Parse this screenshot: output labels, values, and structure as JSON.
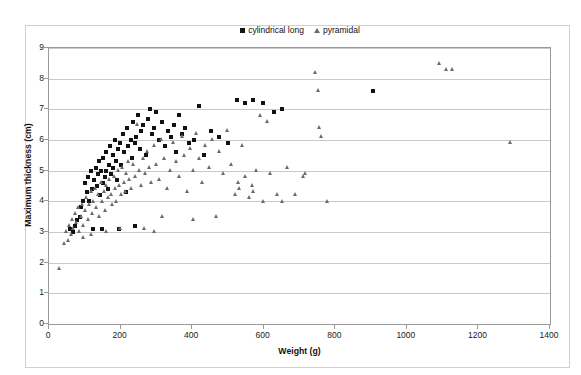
{
  "chart_data": {
    "type": "scatter",
    "title": "",
    "xlabel": "Weight (g)",
    "ylabel": "Maximum thickness (cm)",
    "xlim": [
      0,
      1400
    ],
    "ylim": [
      0,
      9
    ],
    "xticks": [
      0,
      200,
      400,
      600,
      800,
      1000,
      1200,
      1400
    ],
    "yticks": [
      0,
      1,
      2,
      3,
      4,
      5,
      6,
      7,
      8,
      9
    ],
    "grid": "horizontal",
    "legend_position": "top-center",
    "series": [
      {
        "name": "cylindrical long",
        "marker": "square",
        "color": "#121212",
        "points": [
          [
            95,
            4.0
          ],
          [
            100,
            4.6
          ],
          [
            105,
            4.3
          ],
          [
            110,
            4.8
          ],
          [
            112,
            4.0
          ],
          [
            118,
            5.0
          ],
          [
            120,
            4.4
          ],
          [
            124,
            3.1
          ],
          [
            126,
            4.7
          ],
          [
            130,
            5.1
          ],
          [
            134,
            4.5
          ],
          [
            138,
            4.9
          ],
          [
            140,
            5.3
          ],
          [
            142,
            4.2
          ],
          [
            146,
            5.0
          ],
          [
            150,
            4.6
          ],
          [
            152,
            5.4
          ],
          [
            156,
            4.8
          ],
          [
            158,
            5.6
          ],
          [
            160,
            5.0
          ],
          [
            164,
            4.4
          ],
          [
            168,
            5.2
          ],
          [
            170,
            5.8
          ],
          [
            174,
            4.9
          ],
          [
            178,
            5.5
          ],
          [
            180,
            5.1
          ],
          [
            184,
            6.0
          ],
          [
            188,
            5.3
          ],
          [
            190,
            4.7
          ],
          [
            194,
            5.7
          ],
          [
            198,
            5.9
          ],
          [
            200,
            5.2
          ],
          [
            206,
            6.2
          ],
          [
            210,
            5.6
          ],
          [
            214,
            4.3
          ],
          [
            218,
            6.4
          ],
          [
            222,
            5.8
          ],
          [
            228,
            6.0
          ],
          [
            232,
            5.4
          ],
          [
            236,
            6.6
          ],
          [
            240,
            5.9
          ],
          [
            244,
            6.1
          ],
          [
            250,
            6.8
          ],
          [
            254,
            5.7
          ],
          [
            258,
            6.3
          ],
          [
            264,
            6.5
          ],
          [
            270,
            5.5
          ],
          [
            276,
            6.7
          ],
          [
            282,
            7.0
          ],
          [
            288,
            6.2
          ],
          [
            294,
            6.4
          ],
          [
            300,
            6.9
          ],
          [
            308,
            6.0
          ],
          [
            316,
            6.6
          ],
          [
            324,
            5.8
          ],
          [
            332,
            6.3
          ],
          [
            340,
            6.1
          ],
          [
            348,
            6.5
          ],
          [
            356,
            5.6
          ],
          [
            364,
            6.8
          ],
          [
            372,
            6.2
          ],
          [
            380,
            6.4
          ],
          [
            392,
            5.9
          ],
          [
            404,
            6.0
          ],
          [
            418,
            7.1
          ],
          [
            432,
            5.5
          ],
          [
            452,
            6.3
          ],
          [
            476,
            6.1
          ],
          [
            500,
            5.9
          ],
          [
            524,
            7.3
          ],
          [
            548,
            7.2
          ],
          [
            570,
            7.3
          ],
          [
            598,
            7.2
          ],
          [
            628,
            6.9
          ],
          [
            652,
            7.0
          ],
          [
            905,
            7.6
          ],
          [
            86,
            3.5
          ],
          [
            90,
            3.8
          ],
          [
            78,
            3.4
          ],
          [
            72,
            3.2
          ],
          [
            66,
            3.0
          ],
          [
            60,
            3.1
          ],
          [
            148,
            3.1
          ],
          [
            196,
            3.1
          ],
          [
            240,
            3.2
          ]
        ]
      },
      {
        "name": "pyramidal",
        "marker": "triangle",
        "color": "#6b6b6b",
        "points": [
          [
            30,
            1.8
          ],
          [
            44,
            2.6
          ],
          [
            50,
            3.0
          ],
          [
            54,
            2.7
          ],
          [
            58,
            3.2
          ],
          [
            62,
            2.9
          ],
          [
            66,
            3.4
          ],
          [
            70,
            3.1
          ],
          [
            74,
            3.6
          ],
          [
            78,
            3.3
          ],
          [
            82,
            3.8
          ],
          [
            86,
            3.0
          ],
          [
            90,
            3.5
          ],
          [
            94,
            3.9
          ],
          [
            98,
            3.2
          ],
          [
            102,
            3.7
          ],
          [
            106,
            4.1
          ],
          [
            110,
            3.4
          ],
          [
            114,
            3.9
          ],
          [
            118,
            4.3
          ],
          [
            122,
            3.6
          ],
          [
            126,
            4.0
          ],
          [
            130,
            4.4
          ],
          [
            134,
            3.8
          ],
          [
            138,
            4.2
          ],
          [
            142,
            3.5
          ],
          [
            146,
            4.6
          ],
          [
            150,
            4.0
          ],
          [
            154,
            4.3
          ],
          [
            158,
            3.7
          ],
          [
            162,
            4.5
          ],
          [
            166,
            4.1
          ],
          [
            170,
            4.7
          ],
          [
            174,
            4.2
          ],
          [
            178,
            3.9
          ],
          [
            182,
            4.8
          ],
          [
            186,
            4.4
          ],
          [
            190,
            4.0
          ],
          [
            194,
            5.0
          ],
          [
            198,
            4.5
          ],
          [
            202,
            4.2
          ],
          [
            206,
            5.1
          ],
          [
            210,
            4.6
          ],
          [
            214,
            4.3
          ],
          [
            218,
            4.9
          ],
          [
            222,
            5.3
          ],
          [
            226,
            4.7
          ],
          [
            230,
            4.4
          ],
          [
            236,
            5.2
          ],
          [
            242,
            4.8
          ],
          [
            248,
            6.5
          ],
          [
            252,
            5.0
          ],
          [
            258,
            4.5
          ],
          [
            264,
            5.4
          ],
          [
            270,
            4.9
          ],
          [
            276,
            5.6
          ],
          [
            282,
            5.1
          ],
          [
            288,
            4.6
          ],
          [
            294,
            5.8
          ],
          [
            300,
            5.2
          ],
          [
            308,
            4.7
          ],
          [
            316,
            6.0
          ],
          [
            324,
            5.4
          ],
          [
            332,
            4.4
          ],
          [
            340,
            5.0
          ],
          [
            348,
            5.9
          ],
          [
            356,
            5.3
          ],
          [
            364,
            4.8
          ],
          [
            372,
            6.1
          ],
          [
            380,
            5.5
          ],
          [
            388,
            4.3
          ],
          [
            396,
            5.7
          ],
          [
            404,
            5.0
          ],
          [
            412,
            6.2
          ],
          [
            420,
            5.4
          ],
          [
            428,
            4.6
          ],
          [
            438,
            5.8
          ],
          [
            448,
            5.1
          ],
          [
            458,
            6.0
          ],
          [
            468,
            3.5
          ],
          [
            478,
            5.6
          ],
          [
            488,
            4.9
          ],
          [
            498,
            6.3
          ],
          [
            510,
            5.2
          ],
          [
            522,
            4.2
          ],
          [
            530,
            4.6
          ],
          [
            532,
            4.4
          ],
          [
            540,
            5.8
          ],
          [
            550,
            4.8
          ],
          [
            560,
            4.1
          ],
          [
            568,
            4.5
          ],
          [
            572,
            4.3
          ],
          [
            580,
            5.0
          ],
          [
            590,
            6.8
          ],
          [
            600,
            4.0
          ],
          [
            610,
            6.6
          ],
          [
            620,
            4.9
          ],
          [
            640,
            4.2
          ],
          [
            652,
            4.0
          ],
          [
            668,
            5.1
          ],
          [
            690,
            4.2
          ],
          [
            712,
            4.8
          ],
          [
            718,
            4.9
          ],
          [
            746,
            8.2
          ],
          [
            754,
            7.6
          ],
          [
            756,
            6.4
          ],
          [
            762,
            6.1
          ],
          [
            778,
            4.0
          ],
          [
            1092,
            8.5
          ],
          [
            1112,
            8.3
          ],
          [
            1128,
            8.3
          ],
          [
            1290,
            5.9
          ],
          [
            200,
            3.1
          ],
          [
            160,
            3.0
          ],
          [
            118,
            2.9
          ],
          [
            96,
            2.8
          ],
          [
            268,
            3.1
          ],
          [
            296,
            3.0
          ],
          [
            318,
            3.5
          ],
          [
            404,
            3.4
          ]
        ]
      }
    ]
  },
  "legend": {
    "items": [
      {
        "label": "cylindrical long",
        "marker": "square"
      },
      {
        "label": "pyramidal",
        "marker": "triangle"
      }
    ]
  },
  "axes": {
    "x_title": "Weight (g)",
    "y_title": "Maximum thickness (cm)"
  }
}
